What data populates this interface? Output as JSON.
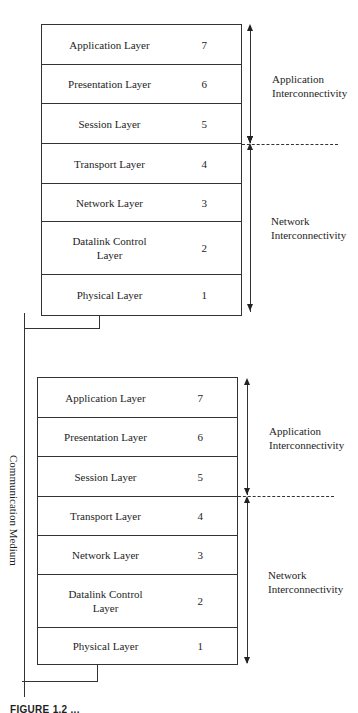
{
  "figure": {
    "type": "OSI reference model - two communicating stacks",
    "stacks": [
      {
        "id": "top",
        "layers": [
          {
            "name": "Application Layer",
            "number": "7"
          },
          {
            "name": "Presentation Layer",
            "number": "6"
          },
          {
            "name": "Session Layer",
            "number": "5"
          },
          {
            "name": "Transport Layer",
            "number": "4"
          },
          {
            "name": "Network Layer",
            "number": "3"
          },
          {
            "name": "Datalink Control Layer",
            "number": "2"
          },
          {
            "name": "Physical Layer",
            "number": "1"
          }
        ],
        "groups": [
          {
            "label_line1": "Application",
            "label_line2": "Interconnectivity",
            "covers": "7-5"
          },
          {
            "label_line1": "Network",
            "label_line2": "Interconnectivity",
            "covers": "4-1"
          }
        ]
      },
      {
        "id": "bottom",
        "layers": [
          {
            "name": "Application Layer",
            "number": "7"
          },
          {
            "name": "Presentation Layer",
            "number": "6"
          },
          {
            "name": "Session Layer",
            "number": "5"
          },
          {
            "name": "Transport Layer",
            "number": "4"
          },
          {
            "name": "Network Layer",
            "number": "3"
          },
          {
            "name": "Datalink Control Layer",
            "number": "2"
          },
          {
            "name": "Physical Layer",
            "number": "1"
          }
        ],
        "groups": [
          {
            "label_line1": "Application",
            "label_line2": "Interconnectivity",
            "covers": "7-5"
          },
          {
            "label_line1": "Network",
            "label_line2": "Interconnectivity",
            "covers": "4-1"
          }
        ]
      }
    ],
    "medium_label": "Communication Medium",
    "caption": "FIGURE 1.2 ..."
  },
  "colors": {
    "line": "#333333",
    "text": "#1e1e1e",
    "background": "#ffffff"
  }
}
